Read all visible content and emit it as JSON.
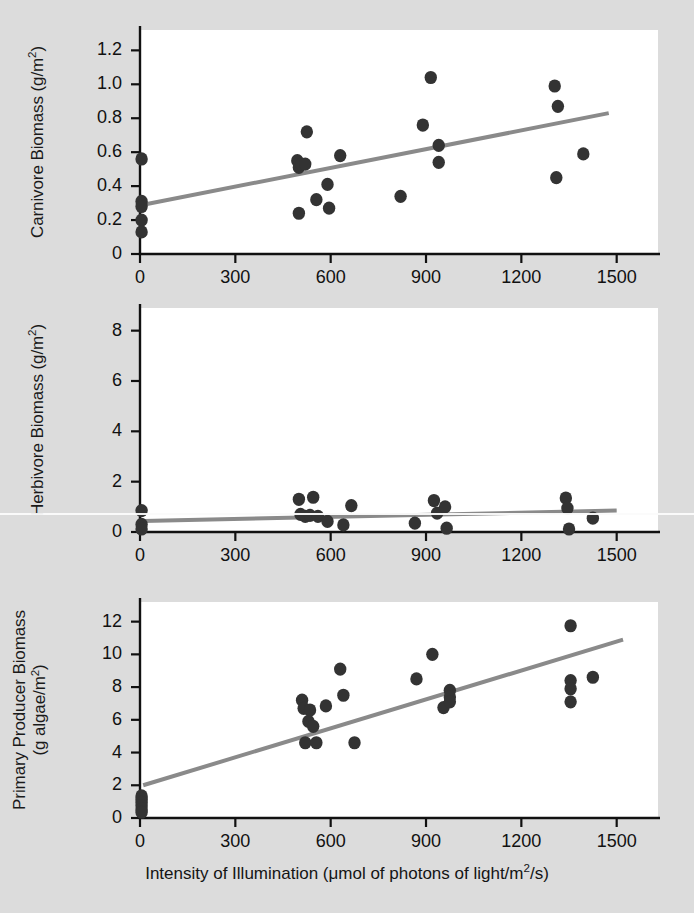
{
  "figure": {
    "background_color": "#dcdcdc",
    "plot_background_color": "#ffffff",
    "point_color": "#333333",
    "line_color": "#8a8a8a",
    "axis_color": "#111111",
    "xaxis_title": "Intensity of Illumination (μmol of photons of light/m²/s)"
  },
  "chart_data": [
    {
      "type": "scatter",
      "title": "",
      "panel_index": 0,
      "xlabel": "Intensity of Illumination (μmol of photons of light/m²/s)",
      "ylabel": "Carnivore Biomass (g/m²)",
      "ylabel_lines": [
        "Carnivore Biomass (g/m²)"
      ],
      "xlim": [
        0,
        1630
      ],
      "ylim": [
        0,
        1.32
      ],
      "xticks": [
        0,
        300,
        600,
        900,
        1200,
        1500
      ],
      "xticklabels": [
        "0",
        "300",
        "600",
        "900",
        "1200",
        "1500"
      ],
      "yticks": [
        0,
        0.2,
        0.4,
        0.6,
        0.8,
        1.0,
        1.2
      ],
      "yticklabels": [
        "0",
        "0.2",
        "0.4",
        "0.6",
        "0.8",
        "1.0",
        "1.2"
      ],
      "grid": false,
      "legend": null,
      "points": [
        {
          "x": 5,
          "y": 0.56
        },
        {
          "x": 5,
          "y": 0.31
        },
        {
          "x": 5,
          "y": 0.28
        },
        {
          "x": 5,
          "y": 0.2
        },
        {
          "x": 5,
          "y": 0.13
        },
        {
          "x": 495,
          "y": 0.55
        },
        {
          "x": 500,
          "y": 0.51
        },
        {
          "x": 508,
          "y": 0.53
        },
        {
          "x": 520,
          "y": 0.53
        },
        {
          "x": 500,
          "y": 0.24
        },
        {
          "x": 525,
          "y": 0.72
        },
        {
          "x": 555,
          "y": 0.32
        },
        {
          "x": 590,
          "y": 0.41
        },
        {
          "x": 595,
          "y": 0.27
        },
        {
          "x": 630,
          "y": 0.58
        },
        {
          "x": 820,
          "y": 0.34
        },
        {
          "x": 890,
          "y": 0.76
        },
        {
          "x": 915,
          "y": 1.04
        },
        {
          "x": 940,
          "y": 0.64
        },
        {
          "x": 940,
          "y": 0.54
        },
        {
          "x": 1305,
          "y": 0.99
        },
        {
          "x": 1315,
          "y": 0.87
        },
        {
          "x": 1310,
          "y": 0.45
        },
        {
          "x": 1395,
          "y": 0.59
        }
      ],
      "trendline": {
        "x0": 10,
        "y0": 0.29,
        "x1": 1475,
        "y1": 0.83
      }
    },
    {
      "type": "scatter",
      "title": "",
      "panel_index": 1,
      "xlabel": "Intensity of Illumination (μmol of photons of light/m²/s)",
      "ylabel": "Herbivore Biomass (g/m²)",
      "ylabel_lines": [
        "Herbivore Biomass (g/m²)"
      ],
      "xlim": [
        0,
        1630
      ],
      "ylim": [
        0,
        8.9
      ],
      "xticks": [
        0,
        300,
        600,
        900,
        1200,
        1500
      ],
      "xticklabels": [
        "0",
        "300",
        "600",
        "900",
        "1200",
        "1500"
      ],
      "yticks": [
        0,
        2,
        4,
        6,
        8
      ],
      "yticklabels": [
        "0",
        "2",
        "4",
        "6",
        "8"
      ],
      "grid": false,
      "legend": null,
      "points": [
        {
          "x": 5,
          "y": 0.85
        },
        {
          "x": 5,
          "y": 0.3
        },
        {
          "x": 5,
          "y": 0.12
        },
        {
          "x": 500,
          "y": 1.3
        },
        {
          "x": 505,
          "y": 0.7
        },
        {
          "x": 520,
          "y": 0.62
        },
        {
          "x": 535,
          "y": 0.66
        },
        {
          "x": 545,
          "y": 1.38
        },
        {
          "x": 560,
          "y": 0.62
        },
        {
          "x": 590,
          "y": 0.42
        },
        {
          "x": 640,
          "y": 0.28
        },
        {
          "x": 665,
          "y": 1.05
        },
        {
          "x": 865,
          "y": 0.35
        },
        {
          "x": 925,
          "y": 1.25
        },
        {
          "x": 935,
          "y": 0.75
        },
        {
          "x": 960,
          "y": 1.0
        },
        {
          "x": 965,
          "y": 0.15
        },
        {
          "x": 1340,
          "y": 1.35
        },
        {
          "x": 1345,
          "y": 0.95
        },
        {
          "x": 1350,
          "y": 0.12
        },
        {
          "x": 1425,
          "y": 0.55
        }
      ],
      "trendline": {
        "x0": 10,
        "y0": 0.44,
        "x1": 1500,
        "y1": 0.85
      }
    },
    {
      "type": "scatter",
      "title": "",
      "panel_index": 2,
      "xlabel": "Intensity of Illumination (μmol of photons of light/m²/s)",
      "ylabel": "Primary Producer Biomass (g algae/m²)",
      "ylabel_lines": [
        "Primary Producer Biomass",
        "(g algae/m²)"
      ],
      "xlim": [
        0,
        1630
      ],
      "ylim": [
        0,
        13.2
      ],
      "xticks": [
        0,
        300,
        600,
        900,
        1200,
        1500
      ],
      "xticklabels": [
        "0",
        "300",
        "600",
        "900",
        "1200",
        "1500"
      ],
      "yticks": [
        0,
        2,
        4,
        6,
        8,
        10,
        12
      ],
      "yticklabels": [
        "0",
        "2",
        "4",
        "6",
        "8",
        "10",
        "12"
      ],
      "grid": false,
      "legend": null,
      "points": [
        {
          "x": 5,
          "y": 1.35
        },
        {
          "x": 5,
          "y": 1.15
        },
        {
          "x": 5,
          "y": 0.95
        },
        {
          "x": 5,
          "y": 0.75
        },
        {
          "x": 5,
          "y": 0.55
        },
        {
          "x": 5,
          "y": 0.35
        },
        {
          "x": 510,
          "y": 7.2
        },
        {
          "x": 515,
          "y": 6.7
        },
        {
          "x": 520,
          "y": 4.6
        },
        {
          "x": 530,
          "y": 5.9
        },
        {
          "x": 535,
          "y": 6.6
        },
        {
          "x": 545,
          "y": 5.6
        },
        {
          "x": 555,
          "y": 4.6
        },
        {
          "x": 585,
          "y": 6.85
        },
        {
          "x": 630,
          "y": 9.1
        },
        {
          "x": 640,
          "y": 7.5
        },
        {
          "x": 675,
          "y": 4.6
        },
        {
          "x": 870,
          "y": 8.5
        },
        {
          "x": 920,
          "y": 10.0
        },
        {
          "x": 955,
          "y": 6.75
        },
        {
          "x": 975,
          "y": 7.8
        },
        {
          "x": 975,
          "y": 7.4
        },
        {
          "x": 975,
          "y": 7.1
        },
        {
          "x": 1355,
          "y": 11.75
        },
        {
          "x": 1355,
          "y": 8.4
        },
        {
          "x": 1355,
          "y": 7.9
        },
        {
          "x": 1355,
          "y": 7.1
        },
        {
          "x": 1425,
          "y": 8.6
        }
      ],
      "trendline": {
        "x0": 10,
        "y0": 2.0,
        "x1": 1520,
        "y1": 10.9
      }
    }
  ]
}
